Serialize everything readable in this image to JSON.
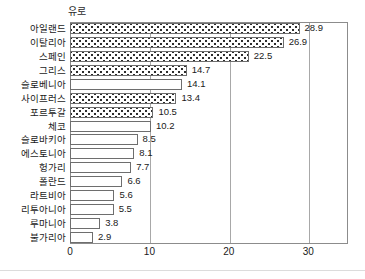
{
  "chart_data": {
    "type": "bar",
    "orientation": "horizontal",
    "title": "유로",
    "xlabel": "",
    "ylabel": "",
    "xlim": [
      0,
      35
    ],
    "xticks": [
      0,
      10,
      20,
      30
    ],
    "grid": true,
    "legend": false,
    "categories": [
      "아일랜드",
      "이탈리아",
      "스페인",
      "그리스",
      "슬로베니아",
      "사이프러스",
      "포르투갈",
      "체코",
      "슬로바키아",
      "에스토니아",
      "헝가리",
      "폴란드",
      "라트비아",
      "리투아니아",
      "루마니아",
      "불가리아"
    ],
    "values": [
      28.9,
      26.9,
      22.5,
      14.7,
      14.1,
      13.4,
      10.5,
      10.2,
      8.5,
      8.1,
      7.7,
      6.6,
      5.6,
      5.5,
      3.8,
      2.9
    ],
    "value_labels": [
      "28.9",
      "26.9",
      "22.5",
      "14.7",
      "14.1",
      "13.4",
      "10.5",
      "10.2",
      "8.5",
      "8.1",
      "7.7",
      "6.6",
      "5.6",
      "5.5",
      "3.8",
      "2.9"
    ],
    "bar_styles": [
      "dotted",
      "dotted",
      "dotted",
      "dotted",
      "plain",
      "dotted",
      "dotted",
      "plain",
      "plain",
      "plain",
      "plain",
      "plain",
      "plain",
      "plain",
      "plain",
      "plain"
    ],
    "colors": {
      "bar_fill": "#ffffff",
      "bar_border": "#6e6e6e",
      "pattern_dot": "#2d2d2d",
      "gridline": "#a8a8a8",
      "axis": "#8c8c8c",
      "text": "#1a1a1a",
      "background": "#ffffff"
    }
  }
}
